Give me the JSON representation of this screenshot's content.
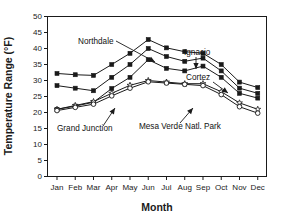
{
  "chart_data": {
    "type": "line",
    "title": "",
    "xlabel": "Month",
    "ylabel": "Temperature Range (°F)",
    "categories": [
      "Jan",
      "Feb",
      "Mar",
      "Apr",
      "May",
      "Jun",
      "Jul",
      "Aug",
      "Sep",
      "Oct",
      "Nov",
      "Dec"
    ],
    "ylim": [
      0,
      50
    ],
    "ytick_step": 5,
    "yticks": [
      "0",
      "5",
      "10",
      "15",
      "20",
      "25",
      "30",
      "35",
      "40",
      "45",
      "50"
    ],
    "grid": false,
    "legend": "inline-annotations",
    "series": [
      {
        "name": "Northdale",
        "marker": "filled-square",
        "values": [
          32.2,
          31.8,
          31.6,
          35.0,
          38.5,
          42.8,
          40.2,
          39.0,
          38.5,
          35.0,
          29.5,
          27.8
        ]
      },
      {
        "name": "Ignacio",
        "marker": "filled-square",
        "values": [
          28.4,
          27.6,
          26.8,
          31.0,
          35.0,
          40.0,
          37.5,
          36.0,
          37.0,
          33.0,
          27.6,
          26.0
        ]
      },
      {
        "name": "Cortez",
        "marker": "filled-square",
        "values": [
          21.0,
          22.0,
          23.2,
          27.5,
          31.0,
          36.5,
          33.8,
          33.0,
          34.5,
          31.0,
          26.0,
          24.5
        ]
      },
      {
        "name": "Grand Junction",
        "marker": "open-star",
        "values": [
          21.0,
          22.2,
          23.4,
          26.0,
          28.5,
          30.0,
          29.5,
          29.0,
          29.0,
          26.5,
          23.0,
          21.0
        ]
      },
      {
        "name": "Mesa Verde Natl. Park",
        "marker": "open-circle",
        "values": [
          20.6,
          21.6,
          22.6,
          25.2,
          27.6,
          29.6,
          29.2,
          28.8,
          28.4,
          25.6,
          21.8,
          19.8
        ]
      }
    ],
    "annotations": [
      {
        "text": "Northdale",
        "target_series": "Northdale"
      },
      {
        "text": "Ignacio",
        "target_series": "Ignacio"
      },
      {
        "text": "Cortez",
        "target_series": "Cortez"
      },
      {
        "text": "Grand Junction",
        "target_series": "Grand Junction"
      },
      {
        "text": "Mesa Verde Natl. Park",
        "target_series": "Mesa Verde Natl. Park"
      }
    ],
    "colors": {
      "line": "#1a1a1a",
      "background": "#ffffff",
      "text": "#1a1a1a"
    }
  }
}
